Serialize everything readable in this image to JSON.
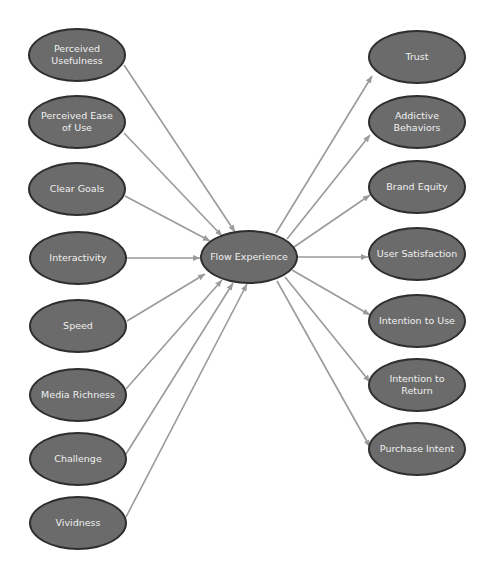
{
  "diagram": {
    "title": "",
    "colors": {
      "node_fill": "#6b6b6b",
      "node_border": "#2e2e2e",
      "node_text": "#f0f0f0",
      "edge": "#9a9a9a",
      "background": "#ffffff"
    },
    "center": {
      "id": "flow",
      "label": "Flow Experience",
      "cx": 249,
      "cy": 257,
      "rx": 49,
      "ry": 27
    },
    "antecedents": [
      {
        "id": "pu",
        "label": "Perceived Usefulness",
        "cx": 77,
        "cy": 55,
        "rx": 49,
        "ry": 27
      },
      {
        "id": "peu",
        "label": "Perceived Ease of Use",
        "cx": 77,
        "cy": 122,
        "rx": 49,
        "ry": 27
      },
      {
        "id": "cg",
        "label": "Clear Goals",
        "cx": 77,
        "cy": 189,
        "rx": 49,
        "ry": 27
      },
      {
        "id": "int",
        "label": "Interactivity",
        "cx": 78,
        "cy": 258,
        "rx": 49,
        "ry": 27
      },
      {
        "id": "sp",
        "label": "Speed",
        "cx": 78,
        "cy": 326,
        "rx": 49,
        "ry": 27
      },
      {
        "id": "mr",
        "label": "Media Richness",
        "cx": 78,
        "cy": 395,
        "rx": 49,
        "ry": 27
      },
      {
        "id": "ch",
        "label": "Challenge",
        "cx": 78,
        "cy": 459,
        "rx": 49,
        "ry": 27
      },
      {
        "id": "vi",
        "label": "Vividness",
        "cx": 78,
        "cy": 523,
        "rx": 49,
        "ry": 27
      }
    ],
    "outcomes": [
      {
        "id": "tr",
        "label": "Trust",
        "cx": 417,
        "cy": 57,
        "rx": 49,
        "ry": 27
      },
      {
        "id": "ab",
        "label": "Addictive Behaviors",
        "cx": 417,
        "cy": 122,
        "rx": 49,
        "ry": 27
      },
      {
        "id": "be",
        "label": "Brand Equity",
        "cx": 417,
        "cy": 187,
        "rx": 49,
        "ry": 27
      },
      {
        "id": "us",
        "label": "User Satisfaction",
        "cx": 417,
        "cy": 254,
        "rx": 49,
        "ry": 27
      },
      {
        "id": "itu",
        "label": "Intention to Use",
        "cx": 417,
        "cy": 321,
        "rx": 49,
        "ry": 27
      },
      {
        "id": "itr",
        "label": "Intention to Return",
        "cx": 417,
        "cy": 385,
        "rx": 49,
        "ry": 27
      },
      {
        "id": "pi",
        "label": "Purchase Intent",
        "cx": 417,
        "cy": 449,
        "rx": 49,
        "ry": 27
      }
    ],
    "edges": [
      {
        "from": "pu",
        "to": "flow",
        "x1": 124,
        "y1": 65,
        "x2": 235,
        "y2": 232
      },
      {
        "from": "peu",
        "to": "flow",
        "x1": 124,
        "y1": 133,
        "x2": 222,
        "y2": 236
      },
      {
        "from": "cg",
        "to": "flow",
        "x1": 125,
        "y1": 196,
        "x2": 210,
        "y2": 241
      },
      {
        "from": "int",
        "to": "flow",
        "x1": 127,
        "y1": 258,
        "x2": 200,
        "y2": 258
      },
      {
        "from": "sp",
        "to": "flow",
        "x1": 127,
        "y1": 321,
        "x2": 205,
        "y2": 274
      },
      {
        "from": "mr",
        "to": "flow",
        "x1": 126,
        "y1": 389,
        "x2": 222,
        "y2": 280
      },
      {
        "from": "ch",
        "to": "flow",
        "x1": 126,
        "y1": 454,
        "x2": 233,
        "y2": 283
      },
      {
        "from": "vi",
        "to": "flow",
        "x1": 126,
        "y1": 517,
        "x2": 247,
        "y2": 284
      },
      {
        "from": "flow",
        "to": "tr",
        "x1": 276,
        "y1": 233,
        "x2": 372,
        "y2": 76
      },
      {
        "from": "flow",
        "to": "ab",
        "x1": 287,
        "y1": 239,
        "x2": 370,
        "y2": 135
      },
      {
        "from": "flow",
        "to": "be",
        "x1": 294,
        "y1": 247,
        "x2": 370,
        "y2": 195
      },
      {
        "from": "flow",
        "to": "us",
        "x1": 298,
        "y1": 257,
        "x2": 368,
        "y2": 257
      },
      {
        "from": "flow",
        "to": "itu",
        "x1": 292,
        "y1": 270,
        "x2": 370,
        "y2": 315
      },
      {
        "from": "flow",
        "to": "itr",
        "x1": 285,
        "y1": 277,
        "x2": 370,
        "y2": 382
      },
      {
        "from": "flow",
        "to": "pi",
        "x1": 277,
        "y1": 281,
        "x2": 370,
        "y2": 447
      }
    ]
  }
}
